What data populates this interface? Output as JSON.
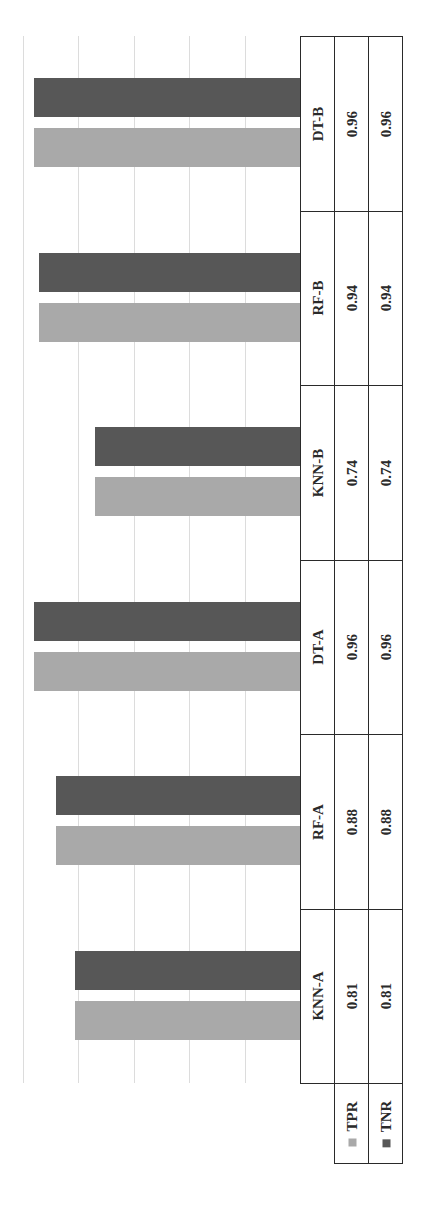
{
  "chart_data": {
    "type": "bar",
    "orientation": "rotated-90-ccw",
    "title": "",
    "xlabel": "",
    "ylabel": "",
    "categories": [
      "KNN-A",
      "RF-A",
      "DT-A",
      "KNN-B",
      "RF-B",
      "DT-B"
    ],
    "series": [
      {
        "name": "TPR",
        "color": "#a9a9a9",
        "values": [
          0.81,
          0.88,
          0.96,
          0.74,
          0.94,
          0.96
        ]
      },
      {
        "name": "TNR",
        "color": "#575757",
        "values": [
          0.81,
          0.88,
          0.96,
          0.74,
          0.94,
          0.96
        ]
      }
    ],
    "ylim": [
      0,
      1.0
    ],
    "gridlines": [
      0.2,
      0.4,
      0.6,
      0.8,
      1.0
    ],
    "grid": true,
    "legend_position": "data-table",
    "data_table": {
      "rows": [
        {
          "label": "TPR",
          "values": [
            "0.81",
            "0.88",
            "0.96",
            "0.74",
            "0.94",
            "0.96"
          ]
        },
        {
          "label": "TNR",
          "values": [
            "0.81",
            "0.88",
            "0.96",
            "0.74",
            "0.94",
            "0.96"
          ]
        }
      ]
    }
  },
  "table": {
    "categories": [
      "KNN-A",
      "RF-A",
      "DT-A",
      "KNN-B",
      "RF-B",
      "DT-B"
    ],
    "tpr_label": "TPR",
    "tnr_label": "TNR",
    "tpr_values": [
      "0.81",
      "0.88",
      "0.96",
      "0.74",
      "0.94",
      "0.96"
    ],
    "tnr_values": [
      "0.81",
      "0.88",
      "0.96",
      "0.74",
      "0.94",
      "0.96"
    ]
  },
  "colors": {
    "tpr": "#a9a9a9",
    "tnr": "#575757",
    "grid": "#dcdcdc",
    "border": "#2a2a2a"
  }
}
